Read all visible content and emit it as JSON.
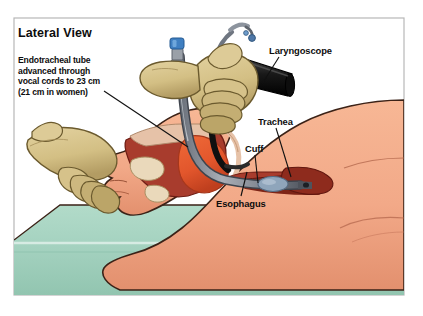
{
  "figure": {
    "title": "Lateral View",
    "caption": "Endotracheal tube\nadvanced through\nvocal cords to 23 cm\n(21 cm in women)",
    "caption_lines": [
      "Endotracheal tube",
      "advanced through",
      "vocal cords to 23 cm",
      "(21 cm in women)"
    ],
    "depth_cm": "23 cm",
    "depth_cm_women": "21 cm in women",
    "labels": [
      {
        "id": "laryngoscope",
        "text": "Laryngoscope"
      },
      {
        "id": "trachea",
        "text": "Trachea"
      },
      {
        "id": "cuff",
        "text": "Cuff"
      },
      {
        "id": "esophagus",
        "text": "Esophagus"
      }
    ],
    "colors": {
      "background": "#ffffff",
      "frame_border": "#b7b7b7",
      "skin": "#f2a988",
      "skin_shadow": "#e08f6d",
      "skin_outline": "#3b2217",
      "glove": "#d8c48b",
      "glove_shadow": "#b9a068",
      "glove_outline": "#6b5a2e",
      "table_pad": "#a6d3c1",
      "table_pad_shadow": "#8cc1ac",
      "oral_cavity": "#a83c2d",
      "tongue": "#e2562c",
      "soft_tissue": "#e6c2a8",
      "tube_grey": "#8a8f99",
      "tube_dark": "#4e535c",
      "laryngoscope_black": "#1a1a1a",
      "pilot_balloon_blue": "#3f7fc1",
      "cuff_blue": "#7e95ad",
      "lumen_dark": "#6e1d14",
      "leader_line": "#111111"
    },
    "icons": [
      "laryngoscope-icon",
      "endotracheal-tube-icon",
      "pilot-balloon-icon",
      "cuff-icon",
      "gloved-hand-icon"
    ]
  }
}
